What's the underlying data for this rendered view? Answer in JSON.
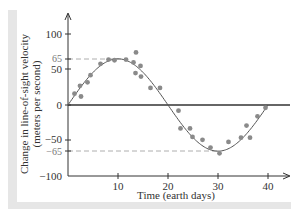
{
  "chart_data": {
    "type": "scatter",
    "title": "",
    "xlabel": "Time (earth days)",
    "ylabel": "Change in line-of-sight velocity",
    "ylabel_line2": "(meters per second)",
    "xlim": [
      0,
      44
    ],
    "ylim": [
      -100,
      100
    ],
    "x_ticks": [
      10,
      20,
      30,
      40
    ],
    "y_ticks": [
      100,
      65,
      50,
      0,
      -50,
      -65,
      -100
    ],
    "y_tick_labels": [
      "100",
      "65",
      "50",
      "0",
      "−50",
      "−65",
      "−100"
    ],
    "reference_lines": [
      {
        "y": 65,
        "style": "dashed",
        "label": "65",
        "x_end": 12
      },
      {
        "y": -65,
        "style": "dashed",
        "label": "−65",
        "x_end": 30
      }
    ],
    "zero_line": true,
    "grid": false,
    "fit_curve": {
      "type": "sine",
      "amplitude": 65,
      "period_days": 40,
      "x_range": [
        0,
        40
      ]
    },
    "series": [
      {
        "name": "observations",
        "points": [
          [
            1.3,
            16
          ],
          [
            2.4,
            27
          ],
          [
            2.6,
            12
          ],
          [
            3.9,
            32
          ],
          [
            4.5,
            42
          ],
          [
            6.5,
            58
          ],
          [
            8.1,
            64
          ],
          [
            9.3,
            63
          ],
          [
            11.6,
            64
          ],
          [
            13.1,
            60
          ],
          [
            13.6,
            74
          ],
          [
            14.5,
            55
          ],
          [
            13.5,
            45
          ],
          [
            14.6,
            40
          ],
          [
            16.5,
            24
          ],
          [
            18.4,
            24
          ],
          [
            22.1,
            -8
          ],
          [
            22.5,
            -33
          ],
          [
            24.4,
            -33
          ],
          [
            24.9,
            -45
          ],
          [
            26.9,
            -49
          ],
          [
            28.5,
            -60
          ],
          [
            30.3,
            -68
          ],
          [
            32.1,
            -52
          ],
          [
            34.6,
            -46
          ],
          [
            36.4,
            -46
          ],
          [
            35.7,
            -29
          ],
          [
            37.9,
            -16
          ],
          [
            39.5,
            -4
          ]
        ]
      }
    ]
  },
  "labels": {
    "xlabel": "Time (earth days)",
    "ylabel_1": "Change in line-of-sight velocity",
    "ylabel_2": "(meters per second)",
    "x10": "10",
    "x20": "20",
    "x30": "30",
    "x40": "40",
    "y100": "100",
    "y65": "65",
    "y50": "50",
    "y0": "0",
    "ym50": "−50",
    "ym65": "−65",
    "ym100": "−100"
  },
  "colors": {
    "axis": "#333333",
    "points": "#8a8a8a",
    "curve": "#555555",
    "reference": "#9a9a9a",
    "band": "#e6e6e6"
  }
}
